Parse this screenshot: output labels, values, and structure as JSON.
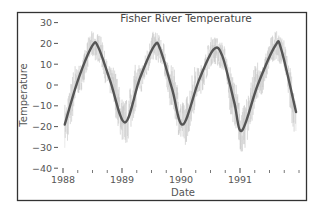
{
  "chart_data": {
    "type": "line",
    "title": "Fisher River Temperature",
    "xlabel": "Date",
    "ylabel": "Temperature",
    "ylim": [
      -40,
      30
    ],
    "xlim": [
      "1988-01-01",
      "1991-12-31"
    ],
    "grid": false,
    "legend": null,
    "yticks": [
      30,
      20,
      10,
      0,
      -10,
      -20,
      -30,
      -40
    ],
    "xticks": [
      "1988",
      "1989",
      "1990",
      "1991"
    ],
    "series": [
      {
        "name": "daily temperature",
        "style": "thin light gray noisy line",
        "color": "#c8c8c8",
        "description": "Daily readings with roughly ±8 degree scatter around smoothed curve"
      },
      {
        "name": "smoothed temperature",
        "style": "thick dark gray line",
        "color": "#555555",
        "x": [
          1988.03,
          1988.25,
          1988.5,
          1988.6,
          1988.8,
          1989.05,
          1989.3,
          1989.55,
          1989.65,
          1989.85,
          1990.03,
          1990.3,
          1990.55,
          1990.7,
          1990.9,
          1991.03,
          1991.3,
          1991.6,
          1991.7,
          1991.95
        ],
        "values": [
          -19,
          2,
          19,
          18,
          2,
          -18,
          3,
          19,
          17,
          -2,
          -19,
          2,
          17,
          14,
          -8,
          -22,
          0,
          19,
          17,
          -13
        ]
      }
    ]
  }
}
